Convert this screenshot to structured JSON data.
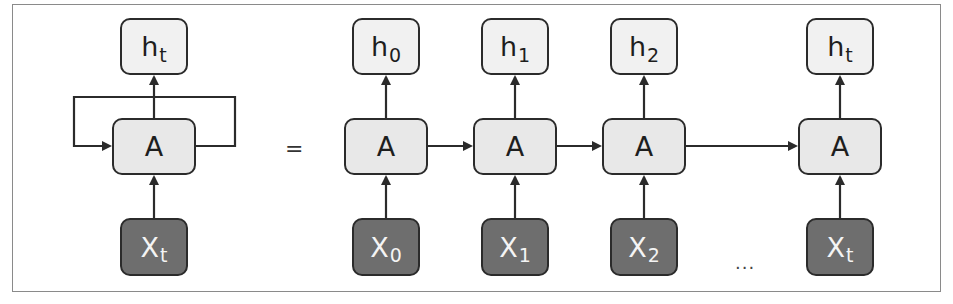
{
  "colors": {
    "border": "#2b2b2b",
    "output_fill": "#f1f1f1",
    "cell_fill": "#e8e8e8",
    "input_fill": "#6e6e6e",
    "frame": "#8a8a8a"
  },
  "folded": {
    "output": {
      "base": "h",
      "sub": "t"
    },
    "cell": {
      "label": "A"
    },
    "input": {
      "base": "X",
      "sub": "t"
    }
  },
  "equals": "=",
  "ellipsis": "...",
  "unrolled": [
    {
      "output": {
        "base": "h",
        "sub": "0"
      },
      "cell": {
        "label": "A"
      },
      "input": {
        "base": "X",
        "sub": "0"
      }
    },
    {
      "output": {
        "base": "h",
        "sub": "1"
      },
      "cell": {
        "label": "A"
      },
      "input": {
        "base": "X",
        "sub": "1"
      }
    },
    {
      "output": {
        "base": "h",
        "sub": "2"
      },
      "cell": {
        "label": "A"
      },
      "input": {
        "base": "X",
        "sub": "2"
      }
    },
    {
      "output": {
        "base": "h",
        "sub": "t"
      },
      "cell": {
        "label": "A"
      },
      "input": {
        "base": "X",
        "sub": "t"
      }
    }
  ]
}
